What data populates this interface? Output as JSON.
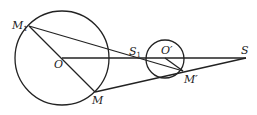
{
  "diagram": {
    "type": "geometry",
    "stroke_color": "#222222",
    "background": "#ffffff",
    "circles": [
      {
        "name": "large",
        "center": "O",
        "cx": 62,
        "cy": 58,
        "r": 47
      },
      {
        "name": "small",
        "center": "O'",
        "cx": 165,
        "cy": 59,
        "r": 19
      }
    ],
    "points": {
      "O": {
        "x": 62,
        "y": 58
      },
      "O_prime": {
        "x": 165,
        "y": 58
      },
      "M": {
        "x": 95,
        "y": 92
      },
      "M1": {
        "x": 29,
        "y": 26
      },
      "M_prime": {
        "x": 183,
        "y": 71
      },
      "S": {
        "x": 246,
        "y": 58
      },
      "S1": {
        "x": 146,
        "y": 58
      }
    },
    "segments": [
      {
        "from": "O",
        "to": "S"
      },
      {
        "from": "M1",
        "to": "M"
      },
      {
        "from": "M1",
        "to": "M_prime"
      },
      {
        "from": "M",
        "to": "S"
      },
      {
        "from": "O_prime",
        "to": "M_prime"
      }
    ],
    "labels": {
      "M1_main": "M",
      "M1_sub": "1",
      "O": "O",
      "S1_main": "S",
      "S1_sub": "1",
      "O_prime": "O′",
      "S": "S",
      "M": "M",
      "M_prime": "M′"
    }
  }
}
